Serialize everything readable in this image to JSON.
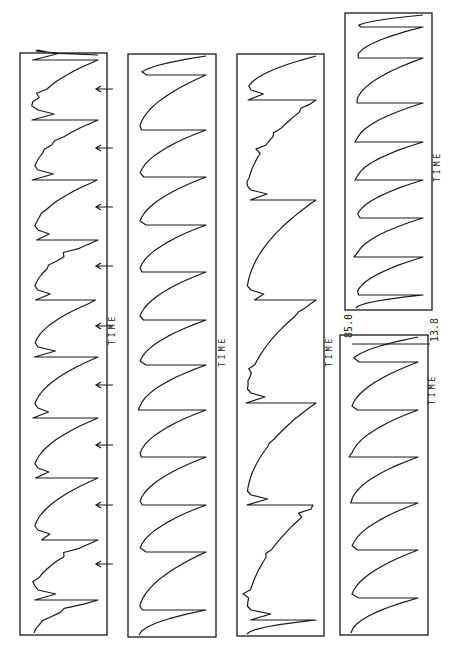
{
  "figure": {
    "orientation": "rotated 90 degrees (time axis runs vertically, top = late, bottom = early)",
    "panels": [
      {
        "id": "panel-1",
        "axis_label": "TIME",
        "has_arrows": true
      },
      {
        "id": "panel-2",
        "axis_label": "TIME"
      },
      {
        "id": "panel-3",
        "axis_label": "TIME"
      },
      {
        "id": "panel-4a",
        "axis_label": "TIME",
        "y_max_label": "85.0",
        "y_min_label": "13.8"
      },
      {
        "id": "panel-4b",
        "axis_label": "TIME"
      }
    ],
    "labels": {
      "time": "TIME",
      "ymax": "85.0",
      "ymin": "13.8"
    }
  },
  "chart_data": [
    {
      "type": "line",
      "title": "Panel 1 (with stimulus arrows)",
      "xlabel": "TIME",
      "ylabel": "",
      "ylim": [
        13.8,
        85.0
      ],
      "description": "Irregular sawtooth: rapid rise then exponential decay with small secondary spikes; 9 arrows mark events",
      "cycle_peaks_y_px": [
        60,
        120,
        180,
        240,
        300,
        357,
        418,
        478,
        540,
        600
      ],
      "arrow_positions_y_px": [
        89,
        148,
        207,
        266,
        326,
        385,
        445,
        505,
        564
      ]
    },
    {
      "type": "line",
      "title": "Panel 2",
      "xlabel": "TIME",
      "ylabel": "",
      "ylim": [
        13.8,
        85.0
      ],
      "description": "Regular sawtooth relaxation oscillation, ~11 cycles",
      "cycle_peaks_y_px": [
        75,
        130,
        177,
        225,
        272,
        320,
        365,
        410,
        457,
        505,
        552,
        610
      ]
    },
    {
      "type": "line",
      "title": "Panel 3",
      "xlabel": "TIME",
      "ylabel": "",
      "ylim": [
        13.8,
        85.0
      ],
      "description": "Slow sawtooth with long cycles and many small ripples, ~4 cycles",
      "cycle_peaks_y_px": [
        100,
        200,
        300,
        403,
        505,
        620
      ]
    },
    {
      "type": "line",
      "title": "Panel 4 (upper segment)",
      "xlabel": "TIME",
      "ylabel": "",
      "ylim": [
        13.8,
        85.0
      ],
      "y_tick_labels": [
        "85.0",
        "13.8"
      ],
      "description": "Regular fast sawtooth, ~8 cycles",
      "cycle_peaks_y_px": [
        27,
        58,
        103,
        142,
        180,
        218,
        257,
        295
      ]
    },
    {
      "type": "line",
      "title": "Panel 4 (lower segment)",
      "xlabel": "TIME",
      "ylabel": "",
      "ylim": [
        13.8,
        85.0
      ],
      "description": "Regular sawtooth continuation, ~6 cycles",
      "cycle_peaks_y_px": [
        362,
        410,
        457,
        503,
        550,
        598
      ]
    }
  ]
}
